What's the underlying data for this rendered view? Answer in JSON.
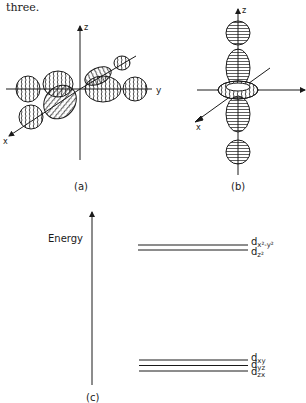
{
  "intro_text": "three.",
  "panel_a": {
    "caption": "(a)",
    "axes": {
      "z": "z",
      "y": "y",
      "x": "x"
    },
    "description": "Four-lobed d orbitals (e.g. dx2-y2) drawn along x and y axes with hatched lobes"
  },
  "panel_b": {
    "caption": "(b)",
    "axes": {
      "z": "z",
      "y": "y",
      "x": "x"
    },
    "description": "dz2 orbital: two lobes along z with a toroidal ring in the xy plane"
  },
  "panel_c": {
    "caption": "(c)",
    "axis_label": "Energy",
    "upper_levels": [
      {
        "sym": "d",
        "sub": "x²-y²",
        "label": "dx2-y2"
      },
      {
        "sym": "d",
        "sub": "z²",
        "label": "dz2"
      }
    ],
    "lower_levels": [
      {
        "sym": "d",
        "sub": "xy",
        "label": "dxy"
      },
      {
        "sym": "d",
        "sub": "yz",
        "label": "dyz"
      },
      {
        "sym": "d",
        "sub": "zx",
        "label": "dzx"
      }
    ]
  },
  "colors": {
    "ink": "#1a1a1a",
    "background": "#ffffff"
  }
}
